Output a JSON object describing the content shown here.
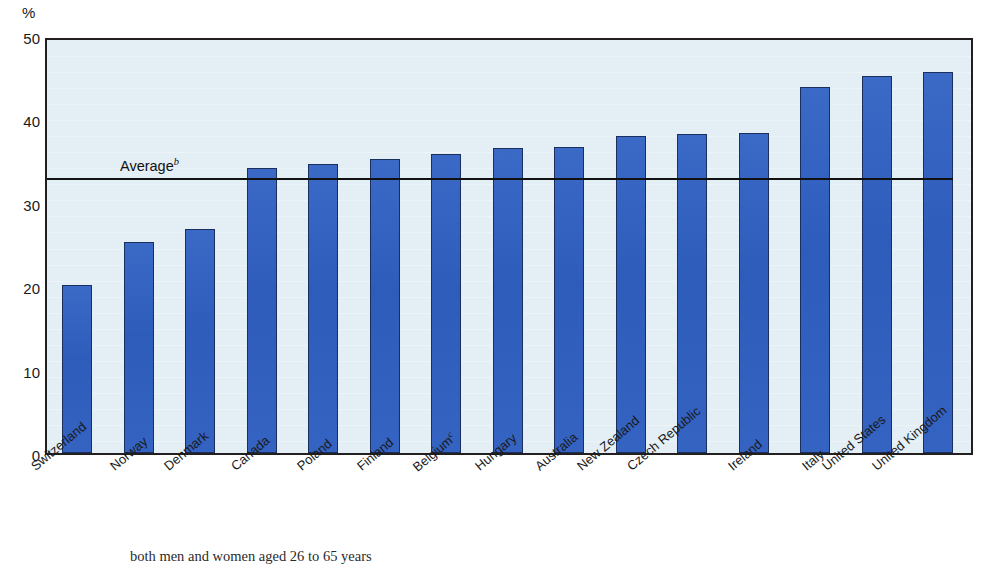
{
  "axis": {
    "unit_label": "%",
    "y_ticks": [
      "0",
      "10",
      "20",
      "30",
      "40",
      "50"
    ]
  },
  "annotation": {
    "average_label": "Average",
    "average_superscript": "b"
  },
  "footnote": {
    "text": "both men and women aged 26 to 65 years"
  },
  "colors": {
    "bar_fill": "#3161c0",
    "bar_stroke": "#1b2f5e",
    "plot_background": "#e3eef5",
    "axis": "#231f20",
    "average_line": "#111111"
  },
  "chart_data": {
    "type": "bar",
    "title": "",
    "xlabel": "",
    "ylabel": "%",
    "ylim": [
      0,
      50
    ],
    "yticks": [
      0,
      10,
      20,
      30,
      40,
      50
    ],
    "grid": false,
    "legend": "none",
    "categories": [
      "Switzerland",
      "Norway",
      "Denmark",
      "Canada",
      "Poland",
      "Finland",
      "Belgium",
      "Hungary",
      "Australia",
      "New Zealand",
      "Czech Republic",
      "Ireland",
      "Italy",
      "United States",
      "United Kingdom"
    ],
    "category_superscripts": [
      "",
      "",
      "",
      "",
      "",
      "",
      "c",
      "",
      "",
      "",
      "",
      "",
      "",
      "",
      ""
    ],
    "values": [
      20.2,
      25.3,
      26.9,
      34.2,
      34.6,
      35.2,
      35.8,
      36.6,
      36.7,
      38.0,
      38.3,
      38.4,
      43.9,
      45.2,
      45.7
    ],
    "annotations": [
      {
        "type": "hline",
        "label": "Average",
        "superscript": "b",
        "value": 33.5
      }
    ]
  }
}
